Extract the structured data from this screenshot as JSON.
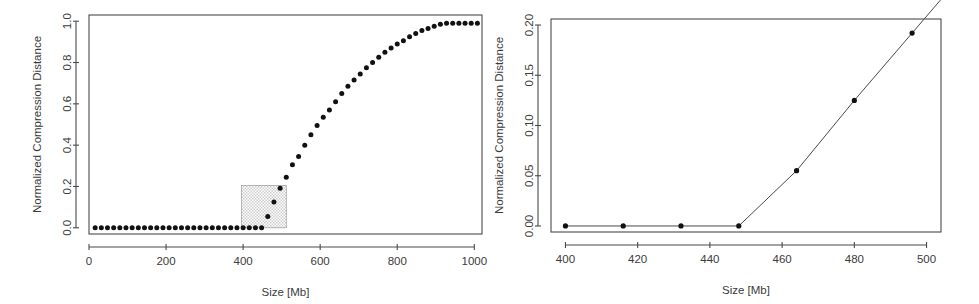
{
  "figure": {
    "background": "#ffffff",
    "point_color": "#111111",
    "axis_color": "#4a4a4a",
    "highlight_color": "#cfcfcf"
  },
  "chart_data": [
    {
      "id": "left",
      "type": "scatter",
      "title": "",
      "xlabel": "Size [Mb]",
      "ylabel": "Normalized Compression Distance",
      "xlim": [
        0,
        1020
      ],
      "ylim": [
        -0.03,
        1.03
      ],
      "xticks": [
        0,
        200,
        400,
        600,
        800,
        1000
      ],
      "xticklabels": [
        "0",
        "200",
        "400",
        "600",
        "800",
        "1000"
      ],
      "yticks": [
        0.0,
        0.2,
        0.4,
        0.6,
        0.8,
        1.0
      ],
      "yticklabels": [
        "0.0",
        "0.2",
        "0.4",
        "0.6",
        "0.8",
        "1.0"
      ],
      "grid": false,
      "legend": "none",
      "marker": "filled-circle",
      "x": [
        16,
        32,
        48,
        64,
        80,
        96,
        112,
        128,
        144,
        160,
        176,
        192,
        208,
        224,
        240,
        256,
        272,
        288,
        304,
        320,
        336,
        352,
        368,
        384,
        400,
        416,
        432,
        448,
        464,
        480,
        496,
        512,
        528,
        544,
        560,
        576,
        592,
        608,
        624,
        640,
        656,
        672,
        688,
        704,
        720,
        736,
        752,
        768,
        784,
        800,
        816,
        832,
        848,
        864,
        880,
        896,
        912,
        928,
        944,
        960,
        976,
        992,
        1008
      ],
      "y": [
        0.0,
        0.0,
        0.0,
        0.0,
        0.0,
        0.0,
        0.0,
        0.0,
        0.0,
        0.0,
        0.0,
        0.0,
        0.0,
        0.0,
        0.0,
        0.0,
        0.0,
        0.0,
        0.0,
        0.0,
        0.0,
        0.0,
        0.0,
        0.0,
        0.0,
        0.0,
        0.0,
        0.0,
        0.055,
        0.125,
        0.192,
        0.245,
        0.305,
        0.345,
        0.4,
        0.45,
        0.495,
        0.535,
        0.57,
        0.61,
        0.65,
        0.685,
        0.715,
        0.745,
        0.775,
        0.8,
        0.825,
        0.85,
        0.87,
        0.89,
        0.905,
        0.925,
        0.94,
        0.955,
        0.965,
        0.975,
        0.985,
        0.99,
        0.99,
        0.99,
        0.99,
        0.99,
        0.99
      ],
      "highlight_rect": {
        "x0": 396,
        "x1": 512,
        "y0": 0.0,
        "y1": 0.205,
        "fill": "#cfcfcf",
        "description": "shaded inset region magnified in right panel"
      }
    },
    {
      "id": "right",
      "type": "line",
      "title": "",
      "xlabel": "Size [Mb]",
      "ylabel": "Normalized Compression Distance",
      "xlim": [
        396,
        504
      ],
      "ylim": [
        -0.006,
        0.206
      ],
      "xticks": [
        400,
        420,
        440,
        460,
        480,
        500
      ],
      "xticklabels": [
        "400",
        "420",
        "440",
        "460",
        "480",
        "500"
      ],
      "yticks": [
        0.0,
        0.05,
        0.1,
        0.15,
        0.2
      ],
      "yticklabels": [
        "0.00",
        "0.05",
        "0.10",
        "0.15",
        "0.20"
      ],
      "grid": false,
      "legend": "none",
      "marker": "filled-circle",
      "connected": true,
      "x": [
        400,
        416,
        432,
        448,
        464,
        480,
        496
      ],
      "y": [
        0.0,
        0.0,
        0.0,
        0.0,
        0.055,
        0.125,
        0.192
      ]
    }
  ]
}
